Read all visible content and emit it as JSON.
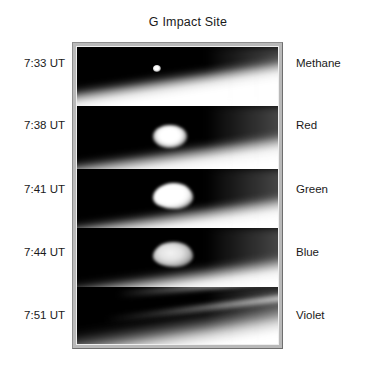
{
  "figure": {
    "title": "G Impact Site",
    "frame_color": "#b9b9b9",
    "background_color": "#ffffff",
    "text_color": "#1a1a1a"
  },
  "chart_data": {
    "type": "heatmap",
    "title": "G Impact Site",
    "xlabel": "",
    "ylabel": "",
    "grid": false,
    "legend_position": "none",
    "row_label_left_header": "Time (UT)",
    "row_label_right_header": "Filter",
    "rows": [
      {
        "time": "7:33 UT",
        "filter": "Methane",
        "feature": "small bright point source above the limb",
        "brightness": 1
      },
      {
        "time": "7:38 UT",
        "filter": "Red",
        "feature": "large bright compact plume blob",
        "brightness": 4
      },
      {
        "time": "7:41 UT",
        "filter": "Green",
        "feature": "large bright irregular plume blob",
        "brightness": 5
      },
      {
        "time": "7:44 UT",
        "filter": "Blue",
        "feature": "fading grey plume blob",
        "brightness": 3
      },
      {
        "time": "7:51 UT",
        "filter": "Violet",
        "feature": "no discrete plume; faint diagonal banding only",
        "brightness": 0
      }
    ],
    "categories": [
      "7:33 UT",
      "7:38 UT",
      "7:41 UT",
      "7:44 UT",
      "7:51 UT"
    ],
    "values": [
      1,
      4,
      5,
      3,
      0
    ],
    "series": [
      {
        "name": "relative plume brightness",
        "values": [
          1,
          4,
          5,
          3,
          0
        ]
      }
    ]
  }
}
